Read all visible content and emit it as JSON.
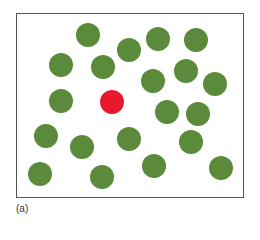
{
  "figure": {
    "caption": "(a)",
    "colors": {
      "normal": "#5a8a3a",
      "highlight": "#e8192c",
      "frame": "#555555"
    },
    "dots": [
      {
        "x": 88,
        "y": 35,
        "kind": "normal"
      },
      {
        "x": 61,
        "y": 65,
        "kind": "normal"
      },
      {
        "x": 103,
        "y": 67,
        "kind": "normal"
      },
      {
        "x": 129,
        "y": 50,
        "kind": "normal"
      },
      {
        "x": 158,
        "y": 39,
        "kind": "normal"
      },
      {
        "x": 196,
        "y": 40,
        "kind": "normal"
      },
      {
        "x": 153,
        "y": 81,
        "kind": "normal"
      },
      {
        "x": 186,
        "y": 71,
        "kind": "normal"
      },
      {
        "x": 215,
        "y": 84,
        "kind": "normal"
      },
      {
        "x": 61,
        "y": 101,
        "kind": "normal"
      },
      {
        "x": 112,
        "y": 102,
        "kind": "highlight"
      },
      {
        "x": 167,
        "y": 112,
        "kind": "normal"
      },
      {
        "x": 198,
        "y": 114,
        "kind": "normal"
      },
      {
        "x": 46,
        "y": 136,
        "kind": "normal"
      },
      {
        "x": 82,
        "y": 147,
        "kind": "normal"
      },
      {
        "x": 129,
        "y": 139,
        "kind": "normal"
      },
      {
        "x": 191,
        "y": 142,
        "kind": "normal"
      },
      {
        "x": 40,
        "y": 174,
        "kind": "normal"
      },
      {
        "x": 102,
        "y": 177,
        "kind": "normal"
      },
      {
        "x": 154,
        "y": 166,
        "kind": "normal"
      },
      {
        "x": 221,
        "y": 168,
        "kind": "normal"
      }
    ]
  }
}
